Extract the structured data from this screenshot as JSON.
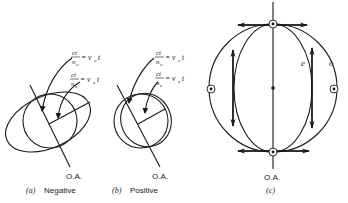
{
  "figure": {
    "panels": [
      {
        "id": "a",
        "caption_letter": "(a)",
        "caption_text": "Negative",
        "axis_label": "O.A.",
        "eq1_num": "ct",
        "eq1_den": "n",
        "eq1_den_sub": "o",
        "eq1_rhs": "= v",
        "eq1_rhs_sub": "o",
        "eq1_rhs_t": "t",
        "eq2_num": "ct",
        "eq2_den": "n",
        "eq2_den_sub": "e",
        "eq2_rhs": "= v",
        "eq2_rhs_sub": "e",
        "eq2_rhs_t": "t"
      },
      {
        "id": "b",
        "caption_letter": "(b)",
        "caption_text": "Positive",
        "axis_label": "O.A.",
        "eq1_num": "ct",
        "eq1_den": "n",
        "eq1_den_sub": "o",
        "eq1_rhs": "= v",
        "eq1_rhs_sub": "o",
        "eq1_rhs_t": "t",
        "eq2_num": "ct",
        "eq2_den": "n",
        "eq2_den_sub": "e",
        "eq2_rhs": "= v",
        "eq2_rhs_sub": "e",
        "eq2_rhs_t": "t"
      },
      {
        "id": "c",
        "caption_letter": "(c)",
        "axis_label": "O.A.",
        "curve_label_e": "e",
        "curve_label_o": "o"
      }
    ],
    "colors": {
      "line": "#1a1a1a",
      "background": "#ffffff"
    }
  }
}
